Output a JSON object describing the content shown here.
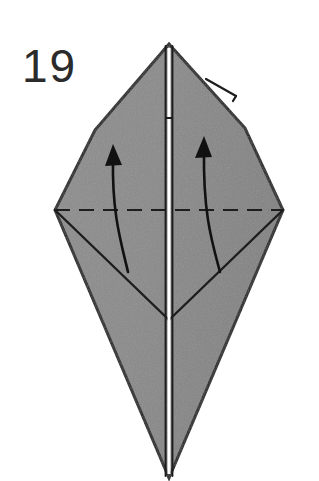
{
  "figure": {
    "kind": "origami-fold-diagram",
    "step_label": "19",
    "background_color": "#ffffff",
    "paper_fill_color": "#8a8a8a",
    "paper_fill_shadow_color": "#7e7e7e",
    "outline_color": "#1d1d1d",
    "crease_color": "#1d1d1d",
    "dashed_fold_color": "#1d1d1d",
    "open_edge_color": "#ffffff",
    "arrow_color": "#111111",
    "canvas": {
      "width": 319,
      "height": 481
    }
  },
  "shape": {
    "name": "kite-base-front-flaps",
    "apex": {
      "x": 169,
      "y": 44
    },
    "left_shoulder": {
      "x": 95,
      "y": 130
    },
    "right_shoulder": {
      "x": 245,
      "y": 128
    },
    "left_vertex": {
      "x": 55,
      "y": 210
    },
    "right_vertex": {
      "x": 283,
      "y": 210
    },
    "bottom_tip": {
      "x": 169,
      "y": 478
    },
    "v_crease_point": {
      "x": 169,
      "y": 320
    },
    "outline_path": "M169,44 L95,130 L55,210 L169,478 L283,210 L245,128 Z",
    "outline_stroke_width": 3
  },
  "creases": {
    "left_diagonal_label": "left-lower-crease",
    "left_diagonal_path": "M55,210 L169,320",
    "right_diagonal_label": "right-lower-crease",
    "right_diagonal_path": "M283,210 L169,320",
    "stroke_width": 2.4
  },
  "center_open_edge": {
    "label": "center-open-edge",
    "top": {
      "x": 169,
      "y": 46
    },
    "bottom": {
      "x": 169,
      "y": 476
    },
    "white_strip_width": 3.2,
    "dark_border_width": 1.9,
    "left_line_x": 165.6,
    "right_line_x": 172.4,
    "notch_y": 118
  },
  "layer_flap": {
    "label": "upper-right-layer-sliver",
    "path": "M206,79 L236,96",
    "tick_path": "M236,96 L233,101",
    "stroke_width": 2.2
  },
  "fold_line": {
    "label": "horizontal-valley-fold",
    "type": "dashed",
    "y": 210,
    "x_start": 55,
    "x_end": 283,
    "dash_length": 15,
    "dash_gap": 9,
    "stroke_width": 2.2
  },
  "arrows": [
    {
      "name": "left-fold-arrow",
      "direction": "up",
      "path": "M128,272 C121,242 112,214 113,160",
      "head_points": "113,144 105,166 122,165",
      "stroke_width": 2.6
    },
    {
      "name": "right-fold-arrow",
      "direction": "up",
      "path": "M220,272 C212,242 203,214 204,150",
      "head_points": "204,136 195,158 212,157",
      "stroke_width": 2.6
    }
  ],
  "step_number": {
    "text": "19",
    "x": 22,
    "y": 82
  }
}
